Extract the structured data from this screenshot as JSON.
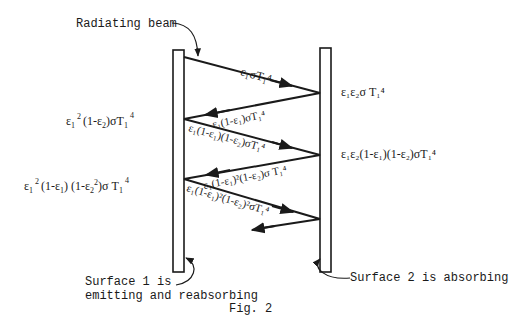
{
  "figure": {
    "caption": "Fig. 2",
    "annotations": {
      "radiating_beam": "Radiating beam",
      "surface1_line1": "Surface 1 is",
      "surface1_line2": "emitting and reabsorbing",
      "surface2": "Surface 2 is absorbing"
    },
    "left_labels": [
      {
        "base": "ε",
        "sub1": "1",
        "sup1": "2",
        "rest": "(1-ε",
        "sub2": "2",
        "tail": ")σT",
        "sub3": "1",
        "sup3": "4"
      },
      {
        "base": "ε",
        "sub1": "1",
        "sup1": "2",
        "rest": "(1-ε",
        "sub2": "1",
        "mid": ") (1-ε",
        "sub4": "2",
        "sup4": "2",
        "tail": ")σ T",
        "sub3": "1",
        "sup3": "4"
      }
    ],
    "right_labels": [
      {
        "text": "ε₁ε₂σ T₁⁴"
      },
      {
        "text": "ε₁ε₂(1-ε₁)(1-ε₂)σT₁⁴"
      }
    ],
    "beam_labels": [
      "ε₁σT₁⁴",
      "ε₁(1-ε₁)σT₁⁴",
      "ε₁(1-ε₁)(1-ε₂)σT₁⁴",
      "ε₁(1-ε₁)²(1-ε₂)σ T₁⁴",
      "ε₁(1-ε₁)²(1-ε₂)²σT₁⁴"
    ],
    "stroke_color": "#1a1a1a"
  }
}
